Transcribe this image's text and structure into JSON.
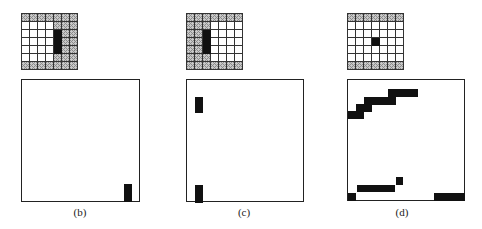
{
  "figure": {
    "legend_codes": {
      "0": "empty",
      "1": "hatched",
      "2": "black"
    },
    "panels": [
      {
        "id": "b",
        "caption": "(b)",
        "grid": [
          [
            1,
            1,
            1,
            1,
            1,
            1,
            1
          ],
          [
            0,
            0,
            0,
            0,
            1,
            1,
            1
          ],
          [
            0,
            0,
            0,
            0,
            2,
            1,
            1
          ],
          [
            0,
            0,
            0,
            0,
            2,
            1,
            1
          ],
          [
            0,
            0,
            0,
            0,
            2,
            1,
            1
          ],
          [
            0,
            0,
            0,
            0,
            1,
            1,
            1
          ],
          [
            1,
            1,
            1,
            1,
            1,
            1,
            1
          ]
        ],
        "box_blocks": [
          {
            "x": 102,
            "y": 104,
            "w": 8,
            "h": 18
          }
        ]
      },
      {
        "id": "c",
        "caption": "(c)",
        "grid": [
          [
            1,
            1,
            1,
            1,
            1,
            1,
            1
          ],
          [
            1,
            1,
            1,
            0,
            0,
            0,
            0
          ],
          [
            1,
            1,
            2,
            0,
            0,
            0,
            0
          ],
          [
            1,
            1,
            2,
            0,
            0,
            0,
            0
          ],
          [
            1,
            1,
            2,
            0,
            0,
            0,
            0
          ],
          [
            1,
            1,
            1,
            0,
            0,
            0,
            0
          ],
          [
            1,
            1,
            1,
            1,
            1,
            1,
            1
          ]
        ],
        "box_blocks": [
          {
            "x": 8,
            "y": 17,
            "w": 8,
            "h": 16
          },
          {
            "x": 8,
            "y": 105,
            "w": 8,
            "h": 18
          }
        ]
      },
      {
        "id": "d",
        "caption": "(d)",
        "grid": [
          [
            1,
            1,
            1,
            1,
            1,
            1,
            1
          ],
          [
            0,
            0,
            0,
            0,
            0,
            0,
            0
          ],
          [
            0,
            0,
            0,
            0,
            0,
            0,
            0
          ],
          [
            0,
            0,
            0,
            2,
            0,
            0,
            0
          ],
          [
            0,
            0,
            0,
            0,
            0,
            0,
            0
          ],
          [
            0,
            0,
            0,
            0,
            0,
            0,
            0
          ],
          [
            1,
            1,
            1,
            1,
            1,
            1,
            1
          ]
        ],
        "box_blocks": [
          {
            "x": 0,
            "y": 31,
            "w": 16,
            "h": 8
          },
          {
            "x": 8,
            "y": 24,
            "w": 16,
            "h": 8
          },
          {
            "x": 16,
            "y": 17,
            "w": 32,
            "h": 8
          },
          {
            "x": 40,
            "y": 9,
            "w": 30,
            "h": 8
          },
          {
            "x": 0,
            "y": 113,
            "w": 8,
            "h": 8
          },
          {
            "x": 9,
            "y": 105,
            "w": 38,
            "h": 7
          },
          {
            "x": 48,
            "y": 97,
            "w": 7,
            "h": 8
          },
          {
            "x": 86,
            "y": 113,
            "w": 31,
            "h": 8
          }
        ]
      }
    ]
  }
}
